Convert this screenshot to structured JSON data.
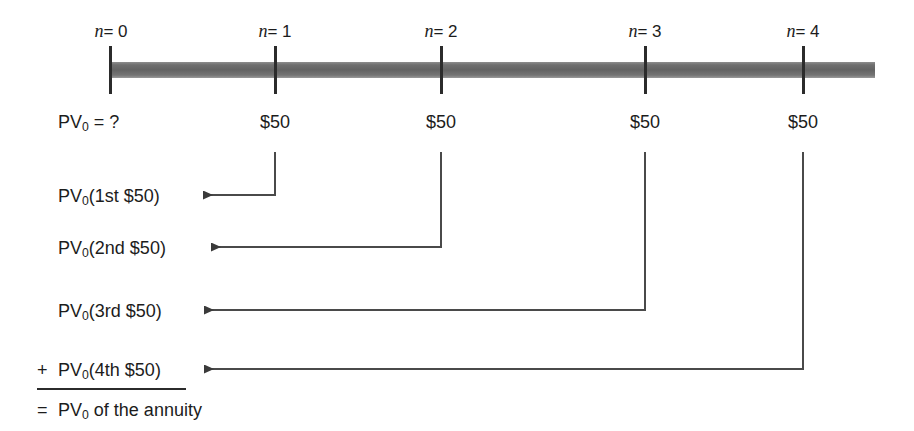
{
  "figure": {
    "colors": {
      "timeline_bar": "#6f6f6f",
      "tick": "#2b2b2b",
      "text": "#1c1c1c",
      "connector": "#4a4a4a",
      "background": "#ffffff"
    }
  },
  "timeline": {
    "periods": [
      {
        "label_prefix": "n",
        "label_suffix": "= 0",
        "n": 0,
        "x": 111,
        "cash_flow": "",
        "pv_label": "PV",
        "pv_sub": "0",
        "pv_tail": " = ?"
      },
      {
        "label_prefix": "n",
        "label_suffix": "= 1",
        "n": 1,
        "x": 275,
        "cash_flow": "$50"
      },
      {
        "label_prefix": "n",
        "label_suffix": "= 2",
        "n": 2,
        "x": 441,
        "cash_flow": "$50"
      },
      {
        "label_prefix": "n",
        "label_suffix": "= 3",
        "n": 3,
        "x": 645,
        "cash_flow": "$50"
      },
      {
        "label_prefix": "n",
        "label_suffix": "= 4",
        "n": 4,
        "x": 803,
        "cash_flow": "$50"
      }
    ],
    "bar_start_x": 111,
    "bar_end_x": 875,
    "unknown_label": {
      "text_before": "PV",
      "subscript": "0",
      "text_after": " = ?"
    }
  },
  "components": [
    {
      "operator": "",
      "text_before": "PV",
      "subscript": "0",
      "text_after": "(1st $50)",
      "source_period": 1,
      "source_x": 275,
      "arrow_tip_x": 192,
      "arrow_y": 195,
      "label_x": 58,
      "label_y": 186
    },
    {
      "operator": "",
      "text_before": "PV",
      "subscript": "0",
      "text_after": "(2nd $50)",
      "source_period": 2,
      "source_x": 441,
      "arrow_tip_x": 200,
      "arrow_y": 247,
      "label_x": 58,
      "label_y": 238
    },
    {
      "operator": "",
      "text_before": "PV",
      "subscript": "0",
      "text_after": "(3rd $50)",
      "source_period": 3,
      "source_x": 645,
      "arrow_tip_x": 193,
      "arrow_y": 310,
      "label_x": 58,
      "label_y": 301
    },
    {
      "operator": "+",
      "text_before": "PV",
      "subscript": "0",
      "text_after": "(4th $50)",
      "source_period": 4,
      "source_x": 803,
      "arrow_tip_x": 193,
      "arrow_y": 369,
      "label_x": 58,
      "label_y": 360,
      "operator_x": 37,
      "operator_y": 360
    }
  ],
  "total": {
    "operator": "=",
    "text_before": "PV",
    "subscript": "0",
    "text_after": " of the annuity",
    "operator_x": 37,
    "operator_y": 400,
    "label_x": 58,
    "label_y": 400
  }
}
